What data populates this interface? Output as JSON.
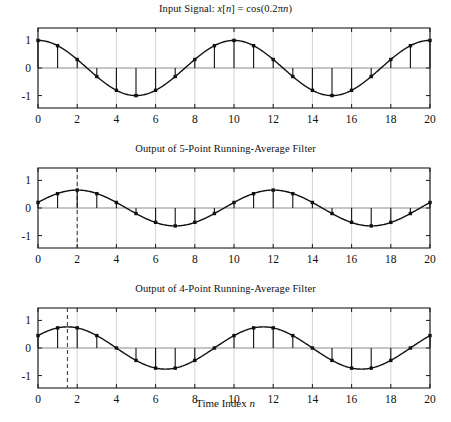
{
  "figure": {
    "xlabel_prefix": "Time Index ",
    "xlabel_var": "n",
    "background": "#ffffff",
    "axis_color": "#1a1a1a",
    "grid_color": "#c8c8c8",
    "curve_color": "#111111",
    "marker_color": "#111111",
    "dash_color": "#333333"
  },
  "chart_data": [
    {
      "type": "line",
      "panel_index": 0,
      "title_parts": {
        "lead": "Input Signal: ",
        "var": "x",
        "index": "[",
        "index_var": "n",
        "index_close": "] = cos(0.2",
        "pi": "π",
        "arg_var": "n",
        "tail": ")"
      },
      "title_plain": "Input Signal: x[n] = cos(0.2πn)",
      "xlabel": "",
      "ylabel": "",
      "xlim": [
        0,
        20
      ],
      "ylim": [
        -1.45,
        1.45
      ],
      "xticks": [
        0,
        2,
        4,
        6,
        8,
        10,
        12,
        14,
        16,
        18,
        20
      ],
      "xticklabels": [
        "0",
        "2",
        "4",
        "6",
        "8",
        "10",
        "12",
        "14",
        "16",
        "18",
        "20"
      ],
      "yticks": [
        -1,
        0,
        1
      ],
      "yticklabels": [
        "-1",
        "0",
        "1"
      ],
      "grid": true,
      "grid_axis": "x",
      "legend": "none",
      "stem": true,
      "x": [
        0,
        1,
        2,
        3,
        4,
        5,
        6,
        7,
        8,
        9,
        10,
        11,
        12,
        13,
        14,
        15,
        16,
        17,
        18,
        19,
        20
      ],
      "values": [
        1.0,
        0.809,
        0.309,
        -0.309,
        -0.809,
        -1.0,
        -0.809,
        -0.309,
        0.309,
        0.809,
        1.0,
        0.809,
        0.309,
        -0.309,
        -0.809,
        -1.0,
        -0.809,
        -0.309,
        0.309,
        0.809,
        1.0
      ],
      "continuous": {
        "amplitude": 1.0,
        "period": 10,
        "phase_shift": 0.0,
        "offset": 0.0
      },
      "dashed_marker": null
    },
    {
      "type": "line",
      "panel_index": 1,
      "title_parts": {
        "lead": "Output of 5-Point Running-Average Filter"
      },
      "title_plain": "Output of 5-Point Running-Average Filter",
      "xlabel": "",
      "ylabel": "",
      "xlim": [
        0,
        20
      ],
      "ylim": [
        -1.45,
        1.45
      ],
      "xticks": [
        0,
        2,
        4,
        6,
        8,
        10,
        12,
        14,
        16,
        18,
        20
      ],
      "xticklabels": [
        "0",
        "2",
        "4",
        "6",
        "8",
        "10",
        "12",
        "14",
        "16",
        "18",
        "20"
      ],
      "yticks": [
        -1,
        0,
        1
      ],
      "yticklabels": [
        "-1",
        "0",
        "1"
      ],
      "grid": true,
      "grid_axis": "x",
      "legend": "none",
      "stem": true,
      "x": [
        0,
        1,
        2,
        3,
        4,
        5,
        6,
        7,
        8,
        9,
        10,
        11,
        12,
        13,
        14,
        15,
        16,
        17,
        18,
        19,
        20
      ],
      "values": [
        0.2,
        0.52,
        0.65,
        0.52,
        0.2,
        -0.2,
        -0.52,
        -0.65,
        -0.52,
        -0.2,
        0.2,
        0.52,
        0.65,
        0.52,
        0.2,
        -0.2,
        -0.52,
        -0.65,
        -0.52,
        -0.2,
        0.2
      ],
      "continuous": {
        "amplitude": 0.65,
        "period": 10,
        "phase_shift": 2.0,
        "offset": 0.0
      },
      "dashed_marker": {
        "x": 2,
        "label": "2",
        "style": "dashed"
      }
    },
    {
      "type": "line",
      "panel_index": 2,
      "title_parts": {
        "lead": "Output of 4-Point Running-Average Filter"
      },
      "title_plain": "Output of 4-Point Running-Average Filter",
      "xlabel": "Time Index n",
      "ylabel": "",
      "xlim": [
        0,
        20
      ],
      "ylim": [
        -1.45,
        1.45
      ],
      "xticks": [
        0,
        2,
        4,
        6,
        8,
        10,
        12,
        14,
        16,
        18,
        20
      ],
      "xticklabels": [
        "0",
        "2",
        "4",
        "6",
        "8",
        "10",
        "12",
        "14",
        "16",
        "18",
        "20"
      ],
      "yticks": [
        -1,
        0,
        1
      ],
      "yticklabels": [
        "-1",
        "0",
        "1"
      ],
      "grid": true,
      "grid_axis": "x",
      "legend": "none",
      "stem": true,
      "x": [
        0,
        1,
        2,
        3,
        4,
        5,
        6,
        7,
        8,
        9,
        10,
        11,
        12,
        13,
        14,
        15,
        16,
        17,
        18,
        19,
        20
      ],
      "values": [
        0.45,
        0.73,
        0.73,
        0.45,
        0.0,
        -0.45,
        -0.73,
        -0.73,
        -0.45,
        0.0,
        0.45,
        0.73,
        0.73,
        0.45,
        0.0,
        -0.45,
        -0.73,
        -0.73,
        -0.45,
        0.0,
        0.45
      ],
      "continuous": {
        "amplitude": 0.765,
        "period": 10,
        "phase_shift": 1.5,
        "offset": 0.0
      },
      "dashed_marker": {
        "x": 1.5,
        "label": "1.5",
        "style": "dashed"
      }
    }
  ]
}
